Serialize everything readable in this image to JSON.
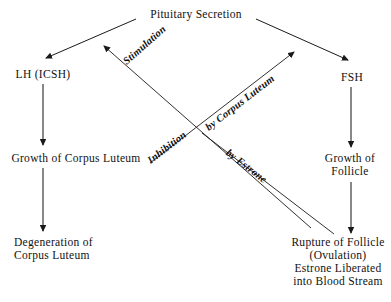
{
  "diagram": {
    "title": "Pituitary Secretion",
    "nodes": {
      "pituitary": {
        "label": "Pituitary Secretion"
      },
      "lh": {
        "label": "LH (ICSH)"
      },
      "fsh": {
        "label": "FSH"
      },
      "growth_corpus_luteum": {
        "label": "Growth of Corpus Luteum"
      },
      "growth_follicle": {
        "line1": "Growth of",
        "line2": "Follicle"
      },
      "degeneration_corpus_luteum": {
        "line1": "Degeneration of",
        "line2": "Corpus Luteum"
      },
      "rupture_follicle": {
        "line1": "Rupture of Follicle",
        "line2": "(Ovulation)",
        "line3": "Estrone Liberated",
        "line4": "into Blood Stream"
      }
    },
    "edge_labels": {
      "stimulation": "Stimulation",
      "inhibition": "Inhibition",
      "by_corpus_luteum": "by Corpus Luteum",
      "by_estrone": "by Estrone"
    },
    "colors": {
      "ink": "#111111",
      "background": "#ffffff",
      "stroke": "#1a1a1a"
    }
  }
}
